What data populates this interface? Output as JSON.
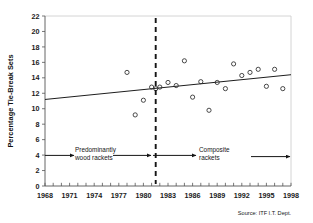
{
  "chart_data": {
    "type": "scatter",
    "title": "",
    "xlabel": "",
    "ylabel": "Percentage Tie-Break Sets",
    "xlim": [
      1968,
      1998
    ],
    "ylim": [
      0,
      22
    ],
    "grid": false,
    "legend": null,
    "x_ticks_major": [
      1968,
      1971,
      1974,
      1977,
      1980,
      1983,
      1986,
      1989,
      1992,
      1995,
      1998
    ],
    "x_tick_minor_step": 1,
    "y_ticks": [
      0,
      2,
      4,
      6,
      8,
      10,
      12,
      14,
      16,
      18,
      20,
      22
    ],
    "x": [
      1978,
      1979,
      1980,
      1981,
      1981.5,
      1982,
      1983,
      1984,
      1985,
      1986,
      1987,
      1988,
      1989,
      1990,
      1991,
      1992,
      1993,
      1994,
      1995,
      1996,
      1997
    ],
    "values": [
      14.7,
      9.2,
      11.1,
      12.8,
      12.6,
      12.8,
      13.4,
      13.0,
      16.2,
      11.5,
      13.5,
      9.8,
      13.4,
      12.6,
      15.8,
      14.3,
      14.7,
      15.1,
      12.9,
      15.1,
      12.6
    ],
    "points": [
      {
        "x": 1978,
        "y": 14.7
      },
      {
        "x": 1979,
        "y": 9.2
      },
      {
        "x": 1980,
        "y": 11.1
      },
      {
        "x": 1981,
        "y": 12.8
      },
      {
        "x": 1981.5,
        "y": 12.6
      },
      {
        "x": 1982,
        "y": 12.8
      },
      {
        "x": 1983,
        "y": 13.4
      },
      {
        "x": 1984,
        "y": 13.0
      },
      {
        "x": 1985,
        "y": 16.2
      },
      {
        "x": 1986,
        "y": 11.5
      },
      {
        "x": 1987,
        "y": 13.5
      },
      {
        "x": 1988,
        "y": 9.8
      },
      {
        "x": 1989,
        "y": 13.4
      },
      {
        "x": 1990,
        "y": 12.6
      },
      {
        "x": 1991,
        "y": 15.8
      },
      {
        "x": 1992,
        "y": 14.3
      },
      {
        "x": 1993,
        "y": 14.7
      },
      {
        "x": 1994,
        "y": 15.1
      },
      {
        "x": 1995,
        "y": 12.9
      },
      {
        "x": 1996,
        "y": 15.1
      },
      {
        "x": 1997,
        "y": 12.6
      }
    ],
    "trendline": {
      "name": "linear trend",
      "x_start": 1968,
      "y_start": 11.2,
      "x_end": 1998,
      "y_end": 14.4
    },
    "annotations": [
      {
        "name": "era-divider",
        "type": "vertical-dashed-line",
        "x": 1981.5
      },
      {
        "name": "wood-era-label",
        "text_line1": "Predominantly",
        "text_line2": "wood rackets",
        "y": 4
      },
      {
        "name": "composite-era-label",
        "text_line1": "Composite",
        "text_line2": "rackets",
        "y": 4
      }
    ],
    "source": "Source: ITF I.T. Dept."
  },
  "axis": {
    "y_title": "Percentage Tie-Break Sets",
    "y_tick_labels": [
      "0",
      "2",
      "4",
      "6",
      "8",
      "10",
      "12",
      "14",
      "16",
      "18",
      "20",
      "22"
    ],
    "x_tick_labels": [
      "1968",
      "1971",
      "1974",
      "1977",
      "1980",
      "1983",
      "1986",
      "1989",
      "1992",
      "1995",
      "1998"
    ]
  },
  "annotations": {
    "wood_line1": "Predominantly",
    "wood_line2": "wood rackets",
    "composite_line1": "Composite",
    "composite_line2": "rackets"
  },
  "footer": {
    "source": "Source: ITF I.T. Dept."
  },
  "colors": {
    "marker_stroke": "#2b2b2b",
    "trend_line": "#1d1d1d",
    "divider": "#151515",
    "axis": "#555555",
    "background": "#ffffff"
  }
}
